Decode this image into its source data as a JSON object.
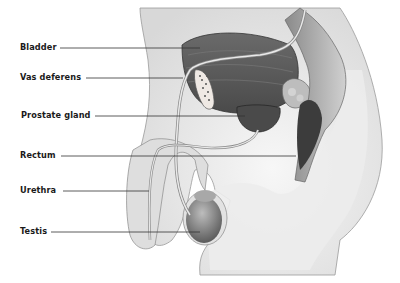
{
  "diagram": {
    "labels": [
      {
        "id": "bladder",
        "text": "Bladder",
        "x": 20,
        "y": 42,
        "line_start": 60,
        "line_end": 200,
        "line_y": 48
      },
      {
        "id": "vas-deferens",
        "text": "Vas deferens",
        "x": 20,
        "y": 71,
        "line_start": 86,
        "line_end": 183,
        "line_y": 78
      },
      {
        "id": "prostate-gland",
        "text": "Prostate gland",
        "x": 21,
        "y": 109,
        "line_start": 95,
        "line_end": 245,
        "line_y": 116
      },
      {
        "id": "rectum",
        "text": "Rectum",
        "x": 20,
        "y": 149,
        "line_start": 61,
        "line_end": 296,
        "line_y": 156
      },
      {
        "id": "urethra",
        "text": "Urethra",
        "x": 20,
        "y": 184,
        "line_start": 63,
        "line_end": 149,
        "line_y": 191
      },
      {
        "id": "testis",
        "text": "Testis",
        "x": 20,
        "y": 225,
        "line_start": 51,
        "line_end": 200,
        "line_y": 232
      }
    ],
    "colors": {
      "label_text": "#1a1a1a",
      "leader_line": "#333333",
      "skin": "#e6e6e6",
      "organ_dark": "#5a5a5a"
    }
  }
}
